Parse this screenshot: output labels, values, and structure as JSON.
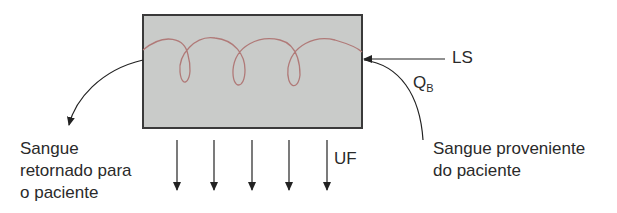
{
  "diagram": {
    "type": "hemodialysis-filter-schematic",
    "labels": {
      "left_line1": "Sangue",
      "left_line2": "retornado para",
      "left_line3": "o paciente",
      "right_line1": "Sangue proveniente",
      "right_line2": "do paciente",
      "ls": "LS",
      "qb_main": "Q",
      "qb_sub": "B",
      "uf": "UF"
    },
    "colors": {
      "box_fill": "#c9cbc9",
      "box_border": "#3a3a3a",
      "coil": "#b07a78",
      "arrows": "#222222"
    },
    "uf_arrow_count": 5
  }
}
